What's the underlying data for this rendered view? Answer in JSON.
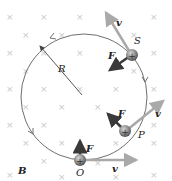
{
  "diagram": {
    "field_label": "B",
    "radius_label": "R",
    "colors": {
      "circle": "#6f6f6f",
      "velocity_arrow": "#a9a9a9",
      "force_arrow": "#3a3a3a",
      "particle": "#8a8a8a",
      "field_x": "#c8c8c8"
    },
    "field_marks_symbol": "×",
    "particles": [
      {
        "name": "O",
        "charge": "+",
        "force_label": "F",
        "velocity_label": "v"
      },
      {
        "name": "P",
        "charge": "+",
        "force_label": "F",
        "velocity_label": "v"
      },
      {
        "name": "S",
        "charge": "+",
        "force_label": "F",
        "velocity_label": "v"
      }
    ]
  }
}
